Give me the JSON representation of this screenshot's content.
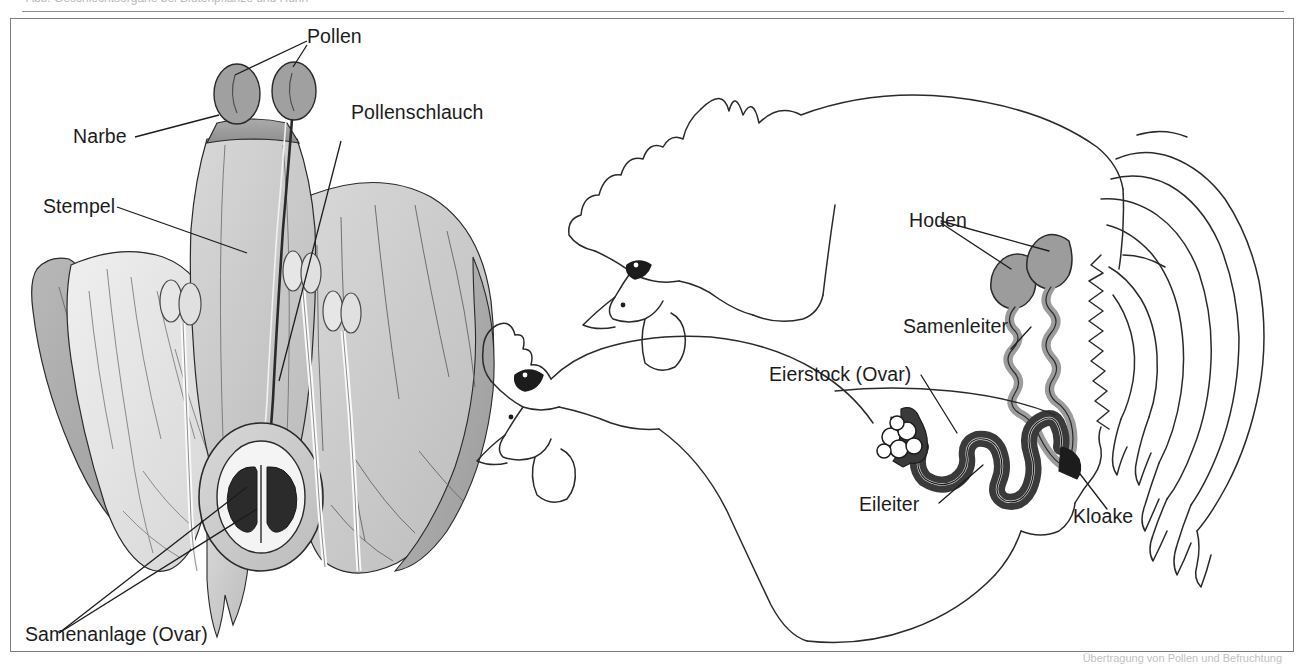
{
  "figure": {
    "top_caption_cut": "Abb. Geschlechtsorgane bei Blütenpflanze und Huhn",
    "bottom_caption_cut": "Übertragung von Pollen und Befruchtung",
    "border_color": "#7c7c7c"
  },
  "flower": {
    "title": "Bluetendiagramm",
    "labels": {
      "pollen": "Pollen",
      "pollenschlauch": "Pollenschlauch",
      "narbe": "Narbe",
      "stempel": "Stempel",
      "samenanlage": "Samenanlage (Ovar)"
    },
    "colors": {
      "petal_light": "#e2e2e2",
      "petal_mid": "#c9c9c9",
      "petal_dark": "#a9a9a9",
      "stigma": "#9a9a9a",
      "ovule": "#2b2b2b",
      "outline": "#2a2a2a"
    }
  },
  "chicken": {
    "title": "Huhn Geschlechtsorgane",
    "labels": {
      "hoden": "Hoden",
      "samenleiter": "Samenleiter",
      "eierstock": "Eierstock (Ovar)",
      "eileiter": "Eileiter",
      "kloake": "Kloake"
    },
    "colors": {
      "outline": "#2a2a2a",
      "male_organ": "#9c9c9c",
      "female_organ": "#3a3a3a"
    }
  }
}
